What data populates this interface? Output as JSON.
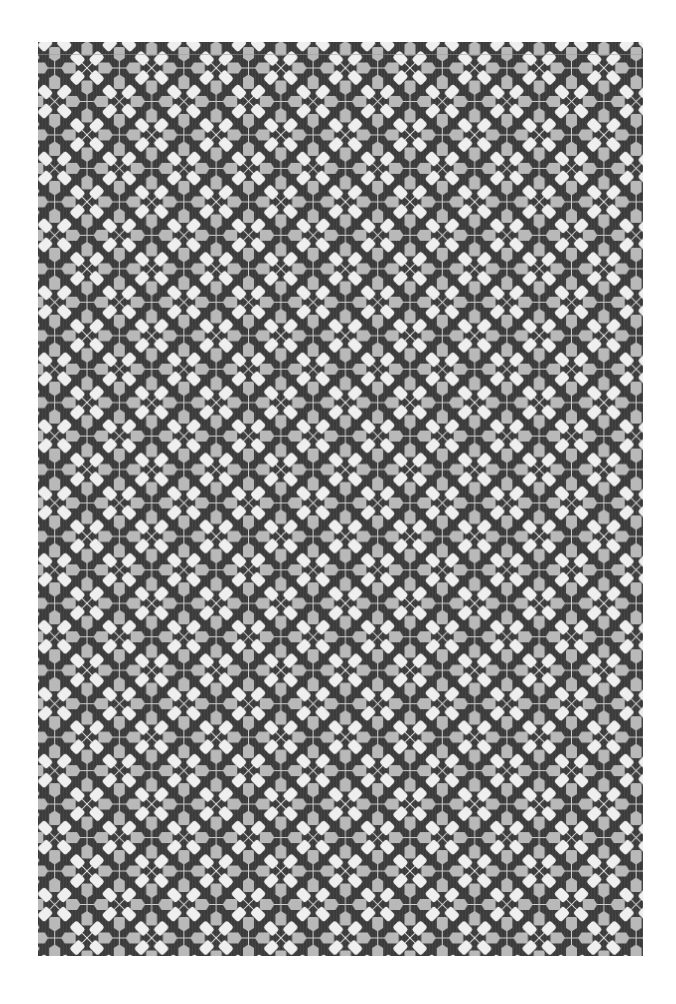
{
  "image": {
    "subject": "Fabric swatch with repeating geometric floral pattern",
    "description": "Dark charcoal textile printed with alternating white four-petal diagonal flowers and light-grey four-petal orthogonal crosses, connected by thin light lines",
    "background_color": "#ffffff"
  },
  "swatch": {
    "x": 38,
    "y": 42,
    "width": 605,
    "height": 914,
    "base_color": "#3b3b3b",
    "stripe_color": "#444444"
  },
  "pattern": {
    "motif_step_x": 32.3,
    "motif_step_y": 33.46,
    "origin_x": 87,
    "origin_y": 68,
    "white_flower": {
      "name": "white diagonal flower",
      "petal_color": "#efefef",
      "line_color": "#e6e6e6",
      "petal_count": 4,
      "orientation": "diagonal"
    },
    "grey_cross": {
      "name": "grey orthogonal cross",
      "petal_color": "#b9b9b9",
      "line_color": "#cfcfcf",
      "petal_count": 4,
      "orientation": "orthogonal"
    }
  }
}
